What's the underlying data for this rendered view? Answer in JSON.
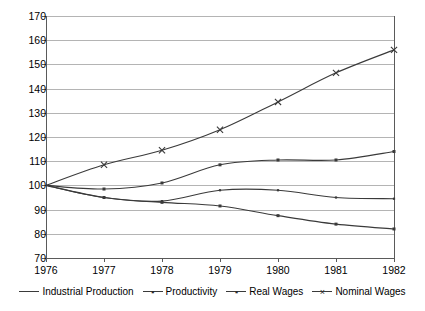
{
  "chart_data": {
    "type": "line",
    "title": "",
    "subtitle": "",
    "xlabel": "",
    "ylabel": "",
    "categories": [
      "1976",
      "1977",
      "1978",
      "1979",
      "1980",
      "1981",
      "1982"
    ],
    "x": [
      1976,
      1977,
      1978,
      1979,
      1980,
      1981,
      1982
    ],
    "xlim": [
      1976,
      1982
    ],
    "ylim": [
      70,
      170
    ],
    "y_ticks": [
      70,
      80,
      90,
      100,
      110,
      120,
      130,
      140,
      150,
      160,
      170
    ],
    "grid": true,
    "legend_position": "bottom",
    "series": [
      {
        "name": "Industrial Production",
        "marker": "small-square",
        "color": "#3a3a3a",
        "values": [
          100,
          95,
          93.5,
          98,
          98,
          95,
          94.5
        ]
      },
      {
        "name": "Productivity",
        "marker": "square",
        "color": "#3a3a3a",
        "values": [
          100,
          98.5,
          101,
          108.5,
          110.5,
          110.5,
          114
        ]
      },
      {
        "name": "Real Wages",
        "marker": "square",
        "color": "#3a3a3a",
        "values": [
          100,
          95,
          93,
          91.5,
          87.5,
          84,
          82
        ]
      },
      {
        "name": "Nominal Wages",
        "marker": "cross",
        "color": "#3a3a3a",
        "values": [
          100,
          108.5,
          114.5,
          123,
          134.5,
          146.5,
          156
        ]
      }
    ]
  },
  "axis": {
    "y_tick_labels": [
      "170",
      "160",
      "150",
      "140",
      "130",
      "120",
      "110",
      "100",
      "90",
      "80",
      "70"
    ],
    "x_tick_labels": [
      "1976",
      "1977",
      "1978",
      "1979",
      "1980",
      "1981",
      "1982"
    ]
  },
  "legend": {
    "items": [
      {
        "label": "Industrial Production",
        "glyph": "—"
      },
      {
        "label": "Productivity",
        "glyph": "▪"
      },
      {
        "label": "Real Wages",
        "glyph": "▪"
      },
      {
        "label": "Nominal Wages",
        "glyph": "×"
      }
    ]
  },
  "colors": {
    "line": "#3a3a3a",
    "grid": "#b4b4b4",
    "axis": "#5a5a5a",
    "background": "#ffffff",
    "text": "#000000"
  }
}
